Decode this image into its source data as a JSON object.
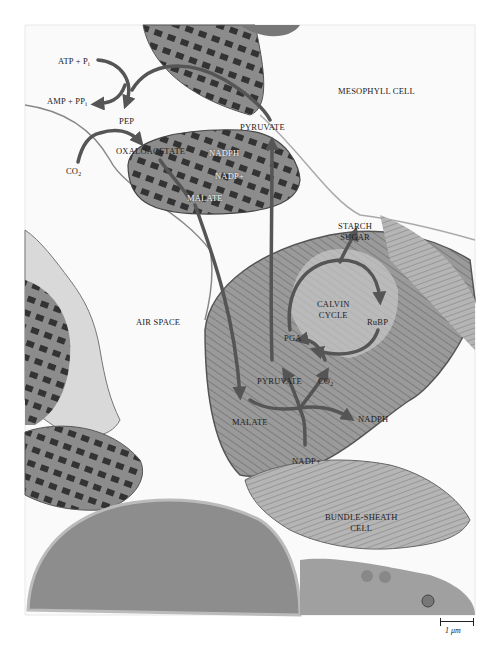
{
  "figure": {
    "type": "electron micrograph with C4 pathway overlay",
    "colors": {
      "arrow": "#555555",
      "background": "#ffffff",
      "tissue_dark": "#3a3a3a",
      "tissue_mid": "#8a8a8a",
      "tissue_light": "#cfcfcf"
    }
  },
  "regions": {
    "mesophyll": "MESOPHYLL CELL",
    "air_space": "AIR SPACE",
    "bundle_sheath_line1": "BUNDLE-SHEATH",
    "bundle_sheath_line2": "CELL"
  },
  "mesophyll_labels": {
    "atp_pi": "ATP + P",
    "atp_pi_sub": "i",
    "amp_ppi": "AMP + PP",
    "amp_ppi_sub": "i",
    "pep": "PEP",
    "co2": "CO",
    "co2_sub": "2",
    "oxaloacetate": "OXALOACETATE",
    "nadph": "NADPH",
    "nadp": "NADP+",
    "malate": "MALATE",
    "pyruvate": "PYRUVATE"
  },
  "bundle_sheath_labels": {
    "starch": "STARCH",
    "sugar": "SUGAR",
    "calvin_line1": "CALVIN",
    "calvin_line2": "CYCLE",
    "rubp": "RuBP",
    "pga": "PGA",
    "pyruvate": "PYRUVATE",
    "co2": "CO",
    "co2_sub": "2",
    "malate": "MALATE",
    "nadph": "NADPH",
    "nadp": "NADP+"
  },
  "scale_bar": {
    "value": "1",
    "unit": "μm"
  }
}
